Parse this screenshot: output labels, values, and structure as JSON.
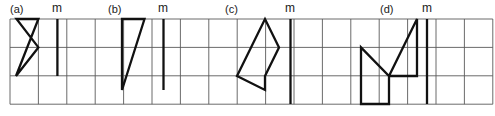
{
  "figure": {
    "title": "",
    "background_color": "#ffffff",
    "grid": {
      "x0": 10,
      "y0": 19,
      "cell": 28.4,
      "cols": 17,
      "rows": 3,
      "line_color": "#5a5a5a",
      "line_width": 0.9,
      "visible": true
    },
    "stroke_color": "#111111",
    "stroke_width": 2.3,
    "mirror_line_color": "#111111",
    "mirror_line_width": 2.3
  },
  "panels": [
    {
      "id": "a",
      "label": "(a)",
      "label_x": 10,
      "label_y": 4,
      "mirror_label": "m",
      "mirror_label_x": 52,
      "mirror_label_y": 2,
      "mirror_line": {
        "x": 57.4,
        "y1": 19,
        "y2": 76
      },
      "shape": {
        "type": "polygon",
        "closed": true,
        "points": [
          [
            16,
            76
          ],
          [
            38.4,
            19
          ],
          [
            16.5,
            19
          ],
          [
            38.4,
            47.4
          ]
        ]
      }
    },
    {
      "id": "b",
      "label": "(b)",
      "label_x": 108,
      "label_y": 4,
      "mirror_label": "m",
      "mirror_label_x": 158,
      "mirror_label_y": 2,
      "mirror_line": {
        "x": 163.5,
        "y1": 19,
        "y2": 90
      },
      "shape": {
        "type": "polygon",
        "closed": true,
        "points": [
          [
            122,
            90
          ],
          [
            122,
            19
          ],
          [
            144.5,
            19
          ],
          [
            122,
            90
          ]
        ]
      }
    },
    {
      "id": "c",
      "label": "(c)",
      "label_x": 225,
      "label_y": 4,
      "mirror_label": "m",
      "mirror_label_x": 285,
      "mirror_label_y": 2,
      "mirror_line": {
        "x": 290.5,
        "y1": 19,
        "y2": 104
      },
      "shape": {
        "type": "polygon",
        "closed": true,
        "points": [
          [
            237,
            76
          ],
          [
            265,
            19
          ],
          [
            279,
            47.4
          ],
          [
            265,
            76
          ],
          [
            265,
            90
          ],
          [
            237,
            76
          ]
        ]
      }
    },
    {
      "id": "d",
      "label": "(d)",
      "label_x": 380,
      "label_y": 4,
      "mirror_label": "m",
      "mirror_label_x": 422,
      "mirror_label_y": 2,
      "mirror_line": {
        "x": 427,
        "y1": 19,
        "y2": 104
      },
      "shape": {
        "type": "polygon",
        "closed": true,
        "points": [
          [
            361,
            47.4
          ],
          [
            361,
            104
          ],
          [
            389,
            104
          ],
          [
            389,
            76
          ],
          [
            417,
            76
          ],
          [
            417,
            19
          ],
          [
            389,
            76
          ],
          [
            361,
            47.4
          ]
        ]
      }
    }
  ],
  "legend": {
    "mirror_symbol": "m",
    "mirror_meaning": "mirror line"
  }
}
